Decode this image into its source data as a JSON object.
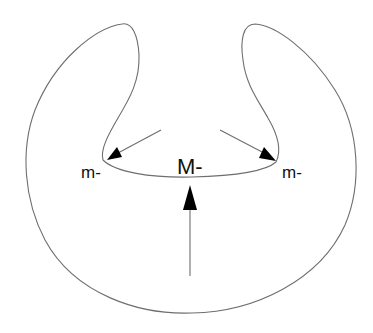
{
  "diagram": {
    "type": "kidney-shaped membrane with notch; arrows pointing toward notch",
    "labels": {
      "left": "m-",
      "center": "M-",
      "right": "m-"
    },
    "arrows": [
      {
        "name": "left-arrow",
        "from": [
          160,
          130
        ],
        "to": [
          108,
          160
        ],
        "direction": "down-left"
      },
      {
        "name": "right-arrow",
        "from": [
          220,
          130
        ],
        "to": [
          275,
          160
        ],
        "direction": "down-right"
      },
      {
        "name": "center-arrow",
        "from": [
          190,
          275
        ],
        "to": [
          190,
          185
        ],
        "direction": "up"
      }
    ],
    "colors": {
      "outline": "#6e6e6e",
      "arrowhead": "#000000",
      "text": "#111111",
      "background": "#ffffff"
    }
  }
}
